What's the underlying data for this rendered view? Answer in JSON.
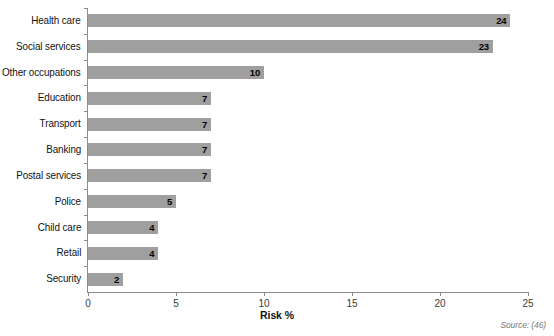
{
  "chart_data": {
    "type": "bar",
    "orientation": "horizontal",
    "title": "",
    "xlabel": "Risk %",
    "ylabel": "",
    "xlim": [
      0,
      25
    ],
    "xticks": [
      0,
      5,
      10,
      15,
      20,
      25
    ],
    "grid": false,
    "legend": null,
    "categories": [
      "Health care",
      "Social services",
      "Other occupations",
      "Education",
      "Transport",
      "Banking",
      "Postal services",
      "Police",
      "Child care",
      "Retail",
      "Security"
    ],
    "values": [
      24,
      23,
      10,
      7,
      7,
      7,
      7,
      5,
      4,
      4,
      2
    ],
    "bar_color": "#7d7d7d",
    "data_labels": [
      "24",
      "23",
      "10",
      "7",
      "7",
      "7",
      "7",
      "5",
      "4",
      "4",
      "2"
    ],
    "annotation": "Source: (46)"
  },
  "axis": {
    "x_title": "Risk %",
    "tick_labels": [
      "0",
      "5",
      "10",
      "15",
      "20",
      "25"
    ]
  },
  "footer": {
    "source": "Source: (46)"
  }
}
